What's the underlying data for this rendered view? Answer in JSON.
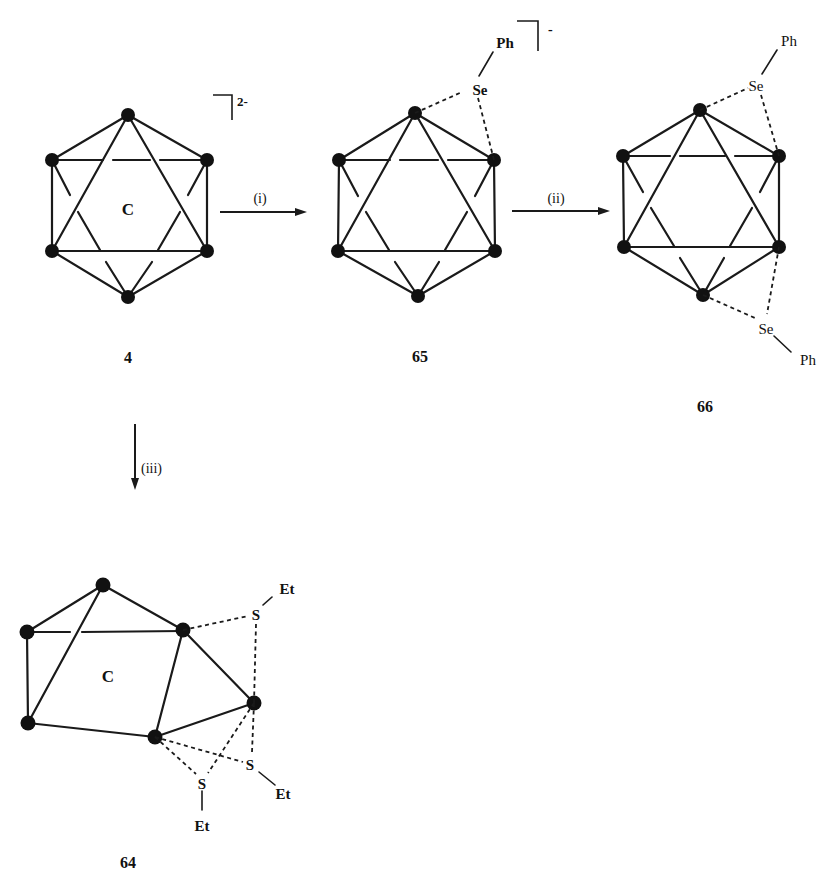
{
  "figure": {
    "compounds": [
      {
        "id": "4",
        "label": "4",
        "cage_label": "C",
        "charge": "2-",
        "type": "closo icosahedral carborane dianion"
      },
      {
        "id": "65",
        "label": "65",
        "cage_label": "C",
        "charge": "-",
        "substituents": [
          {
            "atom": "Se",
            "group": "Ph",
            "bridging": "edge (dashed bonds to 2 cage vertices)"
          }
        ]
      },
      {
        "id": "66",
        "label": "66",
        "cage_label": "C",
        "substituents": [
          {
            "atom": "Se",
            "group": "Ph",
            "position": "upper edge"
          },
          {
            "atom": "Se",
            "group": "Ph",
            "position": "lower edge"
          }
        ]
      },
      {
        "id": "64",
        "label": "64",
        "cage_label": "C",
        "substituents": [
          {
            "atom": "S",
            "group": "Et",
            "position": "upper"
          },
          {
            "atom": "S",
            "group": "Et",
            "position": "right"
          },
          {
            "atom": "S",
            "group": "Et",
            "position": "bottom"
          }
        ]
      }
    ],
    "arrows": [
      {
        "id": "i",
        "label": "(i)",
        "from": "4",
        "to": "65",
        "direction": "right"
      },
      {
        "id": "ii",
        "label": "(ii)",
        "from": "65",
        "to": "66",
        "direction": "right"
      },
      {
        "id": "iii",
        "label": "(iii)",
        "from": "4",
        "to": "64",
        "direction": "down"
      }
    ],
    "atom_labels": {
      "se": "Se",
      "s": "S",
      "ph": "Ph",
      "et": "Et",
      "c": "C"
    }
  }
}
